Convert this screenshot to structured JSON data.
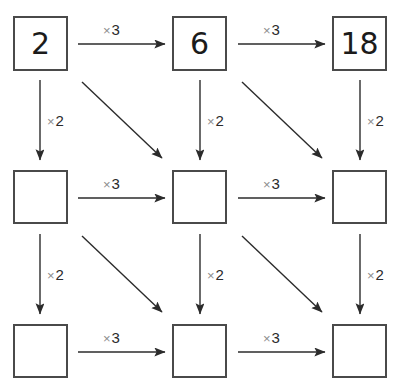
{
  "diagram": {
    "type": "grid-arrow-diagram",
    "canvas": {
      "width": 401,
      "height": 384,
      "background": "#ffffff"
    },
    "colors": {
      "box_border": "#4a4a4a",
      "arrow": "#2b2b2b",
      "times_symbol": "#8c8c8c",
      "number_text": "#1b1b1b",
      "background": "#ffffff"
    },
    "grid": {
      "rows": 3,
      "cols": 3,
      "col_x": [
        13,
        172,
        332
      ],
      "row_y": [
        16,
        170,
        324
      ],
      "box_size": 55
    },
    "cells": [
      {
        "id": "r1c1",
        "row": 1,
        "col": 1,
        "value": "2",
        "filled": true
      },
      {
        "id": "r1c2",
        "row": 1,
        "col": 2,
        "value": "6",
        "filled": true
      },
      {
        "id": "r1c3",
        "row": 1,
        "col": 3,
        "value": "18",
        "filled": true
      },
      {
        "id": "r2c1",
        "row": 2,
        "col": 1,
        "value": "",
        "filled": false
      },
      {
        "id": "r2c2",
        "row": 2,
        "col": 2,
        "value": "",
        "filled": false
      },
      {
        "id": "r2c3",
        "row": 2,
        "col": 3,
        "value": "",
        "filled": false
      },
      {
        "id": "r3c1",
        "row": 3,
        "col": 1,
        "value": "",
        "filled": false
      },
      {
        "id": "r3c2",
        "row": 3,
        "col": 2,
        "value": "",
        "filled": false
      },
      {
        "id": "r3c3",
        "row": 3,
        "col": 3,
        "value": "",
        "filled": false
      }
    ],
    "labels": {
      "times_symbol": "×",
      "multiply_by_three": "3",
      "multiply_by_two": "2",
      "horizontal_text": "× 3",
      "vertical_text": "× 2"
    },
    "arrows": {
      "horizontal": [
        {
          "id": "h-r1-c1c2",
          "from": "r1c1",
          "to": "r1c2",
          "label_times": "×",
          "label_num": "3",
          "x1": 78,
          "y1": 44,
          "x2": 165,
          "y2": 44,
          "label_x": 103,
          "label_y": 21
        },
        {
          "id": "h-r1-c2c3",
          "from": "r1c2",
          "to": "r1c3",
          "label_times": "×",
          "label_num": "3",
          "x1": 238,
          "y1": 44,
          "x2": 325,
          "y2": 44,
          "label_x": 263,
          "label_y": 21
        },
        {
          "id": "h-r2-c1c2",
          "from": "r2c1",
          "to": "r2c2",
          "label_times": "×",
          "label_num": "3",
          "x1": 78,
          "y1": 198,
          "x2": 165,
          "y2": 198,
          "label_x": 103,
          "label_y": 175
        },
        {
          "id": "h-r2-c2c3",
          "from": "r2c2",
          "to": "r2c3",
          "label_times": "×",
          "label_num": "3",
          "x1": 238,
          "y1": 198,
          "x2": 325,
          "y2": 198,
          "label_x": 263,
          "label_y": 175
        },
        {
          "id": "h-r3-c1c2",
          "from": "r3c1",
          "to": "r3c2",
          "label_times": "×",
          "label_num": "3",
          "x1": 78,
          "y1": 352,
          "x2": 165,
          "y2": 352,
          "label_x": 103,
          "label_y": 329
        },
        {
          "id": "h-r3-c2c3",
          "from": "r3c2",
          "to": "r3c3",
          "label_times": "×",
          "label_num": "3",
          "x1": 238,
          "y1": 352,
          "x2": 325,
          "y2": 352,
          "label_x": 263,
          "label_y": 329
        }
      ],
      "vertical": [
        {
          "id": "v-c1-r1r2",
          "from": "r1c1",
          "to": "r2c1",
          "label_times": "×",
          "label_num": "2",
          "x1": 40,
          "y1": 80,
          "x2": 40,
          "y2": 160,
          "label_x": 47,
          "label_y": 112
        },
        {
          "id": "v-c2-r1r2",
          "from": "r1c2",
          "to": "r2c2",
          "label_times": "×",
          "label_num": "2",
          "x1": 200,
          "y1": 80,
          "x2": 200,
          "y2": 160,
          "label_x": 207,
          "label_y": 112
        },
        {
          "id": "v-c3-r1r2",
          "from": "r1c3",
          "to": "r2c3",
          "label_times": "×",
          "label_num": "2",
          "x1": 360,
          "y1": 80,
          "x2": 360,
          "y2": 160,
          "label_x": 367,
          "label_y": 112
        },
        {
          "id": "v-c1-r2r3",
          "from": "r2c1",
          "to": "r3c1",
          "label_times": "×",
          "label_num": "2",
          "x1": 40,
          "y1": 234,
          "x2": 40,
          "y2": 314,
          "label_x": 47,
          "label_y": 266
        },
        {
          "id": "v-c2-r2r3",
          "from": "r2c2",
          "to": "r3c2",
          "label_times": "×",
          "label_num": "2",
          "x1": 200,
          "y1": 234,
          "x2": 200,
          "y2": 314,
          "label_x": 207,
          "label_y": 266
        },
        {
          "id": "v-c3-r2r3",
          "from": "r2c3",
          "to": "r3c3",
          "label_times": "×",
          "label_num": "2",
          "x1": 360,
          "y1": 234,
          "x2": 360,
          "y2": 314,
          "label_x": 367,
          "label_y": 266
        }
      ],
      "diagonal": [
        {
          "id": "d-r1c1-r2c2",
          "from": "r1c1",
          "to": "r2c2",
          "x1": 82,
          "y1": 82,
          "x2": 162,
          "y2": 158
        },
        {
          "id": "d-r1c2-r2c3",
          "from": "r1c2",
          "to": "r2c3",
          "x1": 242,
          "y1": 82,
          "x2": 322,
          "y2": 158
        },
        {
          "id": "d-r2c1-r3c2",
          "from": "r2c1",
          "to": "r3c2",
          "x1": 82,
          "y1": 236,
          "x2": 162,
          "y2": 312
        },
        {
          "id": "d-r2c2-r3c3",
          "from": "r2c2",
          "to": "r3c3",
          "x1": 242,
          "y1": 236,
          "x2": 322,
          "y2": 312
        }
      ]
    }
  }
}
